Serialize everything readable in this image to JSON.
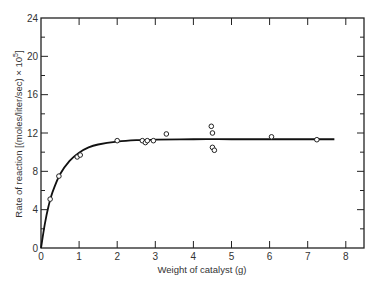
{
  "chart_data": {
    "type": "scatter",
    "title": "",
    "xlabel": "Weight of catalyst (g)",
    "ylabel": "Rate of reaction [(moles/liter/sec) × 10^5]",
    "ylabel_display": "Rate of reaction  [(moles/liter/sec)  ×  10",
    "ylabel_superscript": "5",
    "ylabel_close": "]",
    "xlim": [
      0,
      8.5
    ],
    "ylim": [
      0,
      24
    ],
    "xticks": [
      0,
      1,
      2,
      3,
      4,
      5,
      6,
      7,
      8
    ],
    "xtick_labels": [
      "0",
      "1",
      "2",
      "3",
      "4",
      "5",
      "6",
      "7",
      "8"
    ],
    "yticks": [
      0,
      4,
      8,
      12,
      16,
      20,
      24
    ],
    "ytick_labels": [
      "0",
      "4",
      "8",
      "12",
      "16",
      "20",
      "24"
    ],
    "yminor_ticks": [
      2,
      6,
      10,
      14,
      18,
      22
    ],
    "grid": false,
    "legend": null,
    "series": [
      {
        "name": "Measured data",
        "type": "scatter",
        "marker": "open-circle",
        "x": [
          0.24,
          0.47,
          0.95,
          1.03,
          2.0,
          2.66,
          2.74,
          2.79,
          2.95,
          3.29,
          4.47,
          4.5,
          4.5,
          4.55,
          6.05,
          7.24
        ],
        "y": [
          5.1,
          7.5,
          9.5,
          9.7,
          11.2,
          11.2,
          11.0,
          11.2,
          11.2,
          11.9,
          12.7,
          12.0,
          10.5,
          10.2,
          11.6,
          11.3
        ]
      },
      {
        "name": "Fitted curve",
        "type": "line",
        "x": [
          0,
          0.1,
          0.2,
          0.3,
          0.5,
          0.75,
          1.0,
          1.25,
          1.5,
          2.0,
          2.5,
          3.0,
          4.0,
          5.0,
          6.0,
          7.0,
          7.7
        ],
        "y": [
          0,
          2.5,
          4.4,
          5.8,
          7.7,
          9.1,
          9.95,
          10.5,
          10.8,
          11.1,
          11.25,
          11.3,
          11.35,
          11.35,
          11.35,
          11.35,
          11.35
        ]
      }
    ]
  }
}
